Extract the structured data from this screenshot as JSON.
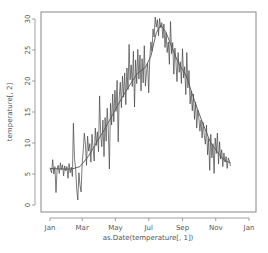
{
  "chart_data": {
    "type": "line",
    "title": "",
    "xlabel": "as.Date(temperature[, 1])",
    "ylabel": "temperature[, 2]",
    "xlim_days": [
      0,
      365
    ],
    "ylim": [
      -1,
      31
    ],
    "grid": false,
    "legend": null,
    "x_ticks": [
      {
        "label": "Jan",
        "day": 0
      },
      {
        "label": "Mar",
        "day": 59
      },
      {
        "label": "May",
        "day": 120
      },
      {
        "label": "Jul",
        "day": 181
      },
      {
        "label": "Sep",
        "day": 243
      },
      {
        "label": "Nov",
        "day": 304
      },
      {
        "label": "Jan",
        "day": 365
      }
    ],
    "y_ticks": [
      0,
      5,
      10,
      15,
      20,
      25,
      30
    ],
    "series": [
      {
        "name": "daily temperature",
        "style": "noisy line",
        "color": "#444444",
        "points": [
          [
            0,
            6.0
          ],
          [
            3,
            5.2
          ],
          [
            5,
            7.3
          ],
          [
            7,
            5.0
          ],
          [
            9,
            6.2
          ],
          [
            11,
            2.0
          ],
          [
            13,
            5.8
          ],
          [
            15,
            6.4
          ],
          [
            17,
            5.1
          ],
          [
            19,
            6.8
          ],
          [
            21,
            5.7
          ],
          [
            23,
            6.5
          ],
          [
            25,
            4.7
          ],
          [
            27,
            6.3
          ],
          [
            29,
            5.5
          ],
          [
            31,
            6.2
          ],
          [
            33,
            4.3
          ],
          [
            35,
            6.7
          ],
          [
            37,
            5.2
          ],
          [
            39,
            6.1
          ],
          [
            41,
            4.6
          ],
          [
            43,
            13.2
          ],
          [
            45,
            7.5
          ],
          [
            47,
            5.9
          ],
          [
            49,
            2.6
          ],
          [
            51,
            0.8
          ],
          [
            53,
            5.2
          ],
          [
            55,
            3.2
          ],
          [
            57,
            2.1
          ],
          [
            59,
            6.8
          ],
          [
            61,
            8.9
          ],
          [
            63,
            11.6
          ],
          [
            65,
            9.8
          ],
          [
            67,
            6.4
          ],
          [
            69,
            11.1
          ],
          [
            71,
            8.7
          ],
          [
            73,
            9.9
          ],
          [
            75,
            6.9
          ],
          [
            77,
            11.4
          ],
          [
            79,
            9.2
          ],
          [
            81,
            7.1
          ],
          [
            83,
            12.4
          ],
          [
            85,
            9.6
          ],
          [
            87,
            11.8
          ],
          [
            89,
            8.6
          ],
          [
            91,
            17.6
          ],
          [
            93,
            11.4
          ],
          [
            95,
            9.4
          ],
          [
            97,
            13.7
          ],
          [
            99,
            7.8
          ],
          [
            101,
            14.1
          ],
          [
            103,
            10.3
          ],
          [
            105,
            15.6
          ],
          [
            107,
            12.2
          ],
          [
            109,
            5.8
          ],
          [
            111,
            16.4
          ],
          [
            113,
            12.9
          ],
          [
            115,
            17.9
          ],
          [
            117,
            13.4
          ],
          [
            119,
            18.5
          ],
          [
            121,
            15.1
          ],
          [
            123,
            20.1
          ],
          [
            125,
            10.2
          ],
          [
            127,
            17.2
          ],
          [
            129,
            19.8
          ],
          [
            131,
            15.7
          ],
          [
            133,
            20.8
          ],
          [
            135,
            17.4
          ],
          [
            137,
            21.3
          ],
          [
            139,
            16.2
          ],
          [
            141,
            22.1
          ],
          [
            143,
            18.6
          ],
          [
            145,
            25.9
          ],
          [
            147,
            20.2
          ],
          [
            149,
            22.6
          ],
          [
            151,
            19.1
          ],
          [
            153,
            24.8
          ],
          [
            155,
            15.8
          ],
          [
            157,
            23.4
          ],
          [
            159,
            19.6
          ],
          [
            161,
            25.1
          ],
          [
            163,
            20.3
          ],
          [
            165,
            24.2
          ],
          [
            167,
            18.4
          ],
          [
            169,
            23.6
          ],
          [
            171,
            19.7
          ],
          [
            173,
            25.7
          ],
          [
            175,
            19.2
          ],
          [
            177,
            21.4
          ],
          [
            179,
            22.9
          ],
          [
            181,
            18.1
          ],
          [
            183,
            23.7
          ],
          [
            185,
            26.3
          ],
          [
            187,
            24.8
          ],
          [
            189,
            28.4
          ],
          [
            191,
            27.1
          ],
          [
            193,
            30.3
          ],
          [
            195,
            28.7
          ],
          [
            197,
            29.9
          ],
          [
            199,
            27.3
          ],
          [
            201,
            30.1
          ],
          [
            203,
            28.6
          ],
          [
            205,
            29.4
          ],
          [
            207,
            26.9
          ],
          [
            209,
            29.2
          ],
          [
            211,
            25.4
          ],
          [
            213,
            27.8
          ],
          [
            215,
            24.6
          ],
          [
            217,
            26.3
          ],
          [
            219,
            22.7
          ],
          [
            221,
            29.6
          ],
          [
            223,
            24.4
          ],
          [
            225,
            26.2
          ],
          [
            227,
            21.1
          ],
          [
            229,
            25.3
          ],
          [
            231,
            23.2
          ],
          [
            233,
            19.9
          ],
          [
            235,
            24.6
          ],
          [
            237,
            21.4
          ],
          [
            239,
            23.1
          ],
          [
            241,
            19.6
          ],
          [
            243,
            25.2
          ],
          [
            245,
            20.5
          ],
          [
            247,
            22.3
          ],
          [
            249,
            17.8
          ],
          [
            251,
            24.6
          ],
          [
            253,
            18.9
          ],
          [
            255,
            21.7
          ],
          [
            257,
            16.3
          ],
          [
            259,
            18.4
          ],
          [
            261,
            15.2
          ],
          [
            263,
            17.9
          ],
          [
            265,
            13.8
          ],
          [
            267,
            16.6
          ],
          [
            269,
            12.4
          ],
          [
            271,
            15.3
          ],
          [
            273,
            14.1
          ],
          [
            275,
            11.9
          ],
          [
            277,
            13.7
          ],
          [
            279,
            10.8
          ],
          [
            281,
            13.3
          ],
          [
            283,
            11.2
          ],
          [
            285,
            9.8
          ],
          [
            287,
            12.9
          ],
          [
            289,
            8.1
          ],
          [
            291,
            10.7
          ],
          [
            293,
            5.6
          ],
          [
            295,
            11.4
          ],
          [
            297,
            7.6
          ],
          [
            299,
            9.9
          ],
          [
            301,
            5.1
          ],
          [
            303,
            10.8
          ],
          [
            305,
            8.3
          ],
          [
            307,
            11.6
          ],
          [
            309,
            6.6
          ],
          [
            311,
            10.2
          ],
          [
            313,
            7.4
          ],
          [
            315,
            8.9
          ],
          [
            317,
            6.2
          ],
          [
            319,
            8.4
          ],
          [
            321,
            6.9
          ],
          [
            323,
            7.8
          ],
          [
            325,
            5.9
          ],
          [
            327,
            7.6
          ],
          [
            329,
            7.1
          ],
          [
            331,
            6.3
          ]
        ]
      },
      {
        "name": "smoothed trend",
        "style": "smooth line",
        "color": "#555555",
        "points": [
          [
            0,
            5.9
          ],
          [
            20,
            5.8
          ],
          [
            40,
            5.8
          ],
          [
            55,
            6.2
          ],
          [
            70,
            7.8
          ],
          [
            85,
            10.0
          ],
          [
            100,
            12.2
          ],
          [
            115,
            14.6
          ],
          [
            130,
            17.0
          ],
          [
            145,
            19.2
          ],
          [
            160,
            21.2
          ],
          [
            175,
            22.2
          ],
          [
            185,
            24.0
          ],
          [
            195,
            27.8
          ],
          [
            203,
            29.0
          ],
          [
            212,
            28.0
          ],
          [
            222,
            25.8
          ],
          [
            235,
            23.0
          ],
          [
            250,
            20.8
          ],
          [
            265,
            16.8
          ],
          [
            280,
            13.2
          ],
          [
            295,
            10.0
          ],
          [
            310,
            8.2
          ],
          [
            320,
            7.2
          ],
          [
            331,
            6.8
          ]
        ]
      }
    ]
  },
  "plot_area": {
    "left": 41,
    "right": 256,
    "top": 12,
    "bottom": 212,
    "x_px_at_day0": 50,
    "x_px_at_day365": 249,
    "y_px_at_0": 205,
    "y_px_at_30": 19
  }
}
